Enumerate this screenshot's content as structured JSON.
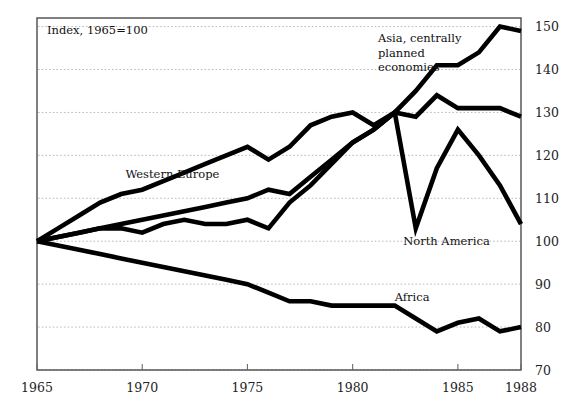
{
  "chart_data": {
    "type": "line",
    "title": "Index, 1965=100",
    "xlabel": "",
    "ylabel": "",
    "xlim": [
      1965,
      1988
    ],
    "ylim": [
      70,
      152
    ],
    "grid": true,
    "legend_position": "inline-annotations",
    "x_ticks": [
      "1965",
      "1970",
      "1975",
      "1980",
      "1985",
      "1988"
    ],
    "x_tick_values": [
      1965,
      1970,
      1975,
      1980,
      1985,
      1988
    ],
    "y_ticks": [
      "70",
      "80",
      "90",
      "100",
      "110",
      "120",
      "130",
      "140",
      "150"
    ],
    "y_tick_values": [
      70,
      80,
      90,
      100,
      110,
      120,
      130,
      140,
      150
    ],
    "x": [
      1965,
      1966,
      1967,
      1968,
      1969,
      1970,
      1971,
      1972,
      1973,
      1974,
      1975,
      1976,
      1977,
      1978,
      1979,
      1980,
      1981,
      1982,
      1983,
      1984,
      1985,
      1986,
      1987,
      1988
    ],
    "series": [
      {
        "name": "Asia, centrally planned economies",
        "label": "Asia, centrally\nplanned\neconomies",
        "values": [
          100,
          101,
          102,
          103,
          104,
          105,
          106,
          107,
          108,
          109,
          110,
          112,
          111,
          115,
          119,
          123,
          126,
          130,
          135,
          141,
          141,
          144,
          150,
          149
        ]
      },
      {
        "name": "Western Europe",
        "label": "Western Europe",
        "values": [
          100,
          103,
          106,
          109,
          111,
          112,
          114,
          116,
          118,
          120,
          122,
          119,
          122,
          127,
          129,
          130,
          127,
          130,
          129,
          134,
          131,
          131,
          131,
          129
        ]
      },
      {
        "name": "North America",
        "label": "North America",
        "values": [
          100,
          101,
          102,
          103,
          103,
          102,
          104,
          105,
          104,
          104,
          105,
          103,
          109,
          113,
          118,
          123,
          126,
          130,
          103,
          117,
          126,
          120,
          113,
          104
        ]
      },
      {
        "name": "Africa",
        "label": "Africa",
        "values": [
          100,
          99,
          98,
          97,
          96,
          95,
          94,
          93,
          92,
          91,
          90,
          88,
          86,
          86,
          85,
          85,
          85,
          85,
          82,
          79,
          81,
          82,
          79,
          80
        ]
      }
    ],
    "annotations": [
      {
        "text": "Asia, centrally",
        "x": 1981.2,
        "y": 146.5
      },
      {
        "text": "planned",
        "x": 1981.2,
        "y": 143.0
      },
      {
        "text": "economies",
        "x": 1981.2,
        "y": 139.6
      },
      {
        "text": "Western Europe",
        "x": 1969.2,
        "y": 114.8
      },
      {
        "text": "North America",
        "x": 1982.4,
        "y": 99.2
      },
      {
        "text": "Africa",
        "x": 1982.0,
        "y": 86.0
      }
    ]
  }
}
